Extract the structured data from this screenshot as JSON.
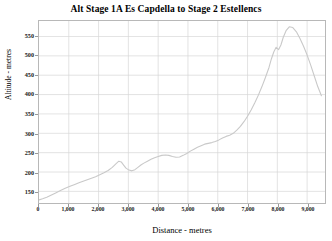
{
  "chart_data": {
    "type": "line",
    "title": "Alt Stage 1A Es Capdella to Stage 2 Estellencs",
    "xlabel": "Distance - metres",
    "ylabel": "Altitude - metres",
    "xlim": [
      0,
      9600
    ],
    "ylim": [
      120,
      590
    ],
    "grid": true,
    "legend": false,
    "x_ticks": [
      0,
      1000,
      2000,
      3000,
      4000,
      5000,
      6000,
      7000,
      8000,
      9000
    ],
    "x_tick_labels": [
      "0",
      "1,000",
      "2,000",
      "3,000",
      "4,000",
      "5,000",
      "6,000",
      "7,000",
      "8,000",
      "9,000"
    ],
    "y_ticks": [
      150,
      200,
      250,
      300,
      350,
      400,
      450,
      500,
      550
    ],
    "y_tick_labels": [
      "150",
      "200",
      "250",
      "300",
      "350",
      "400",
      "450",
      "500",
      "550"
    ],
    "series": [
      {
        "name": "Altitude",
        "color": "#c9c9c9",
        "x": [
          0,
          120,
          260,
          400,
          560,
          720,
          880,
          1040,
          1200,
          1340,
          1480,
          1620,
          1760,
          1900,
          2040,
          2180,
          2320,
          2460,
          2580,
          2680,
          2760,
          2840,
          2920,
          3020,
          3120,
          3220,
          3320,
          3420,
          3520,
          3640,
          3760,
          3880,
          4000,
          4120,
          4240,
          4360,
          4480,
          4600,
          4720,
          4840,
          4960,
          5080,
          5200,
          5320,
          5440,
          5560,
          5680,
          5800,
          5920,
          6040,
          6160,
          6280,
          6400,
          6520,
          6640,
          6760,
          6880,
          7000,
          7120,
          7240,
          7360,
          7480,
          7600,
          7720,
          7800,
          7880,
          7960,
          8040,
          8120,
          8200,
          8300,
          8400,
          8520,
          8640,
          8760,
          8880,
          9000,
          9120,
          9240,
          9360,
          9480
        ],
        "y": [
          128,
          131,
          135,
          140,
          146,
          152,
          158,
          163,
          168,
          172,
          176,
          180,
          184,
          188,
          193,
          198,
          204,
          212,
          221,
          228,
          226,
          218,
          210,
          205,
          203,
          206,
          212,
          218,
          223,
          228,
          233,
          237,
          240,
          243,
          244,
          243,
          240,
          238,
          239,
          243,
          248,
          254,
          259,
          264,
          268,
          272,
          274,
          276,
          279,
          283,
          288,
          292,
          295,
          300,
          308,
          318,
          330,
          344,
          360,
          378,
          398,
          420,
          444,
          470,
          492,
          510,
          522,
          516,
          528,
          548,
          566,
          575,
          573,
          562,
          545,
          525,
          502,
          476,
          448,
          420,
          397
        ]
      }
    ]
  }
}
